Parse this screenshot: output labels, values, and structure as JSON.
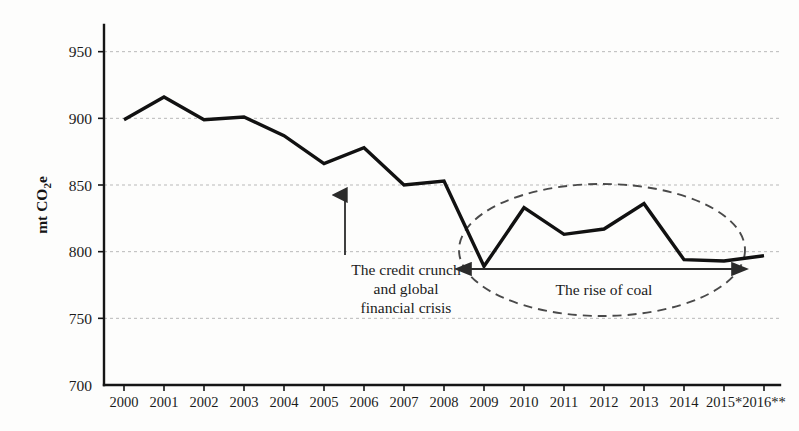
{
  "chart_data": {
    "type": "line",
    "title": "",
    "xlabel": "",
    "ylabel": "mt CO₂e",
    "ylim": [
      700,
      970
    ],
    "xlim_categories_count": 17,
    "grid": true,
    "legend": "none",
    "categories": [
      "2000",
      "2001",
      "2002",
      "2003",
      "2004",
      "2005",
      "2006",
      "2007",
      "2008",
      "2009",
      "2010",
      "2011",
      "2012",
      "2013",
      "2014",
      "2015*",
      "2016**"
    ],
    "values": [
      899,
      916,
      899,
      901,
      887,
      866,
      878,
      850,
      853,
      789,
      833,
      813,
      817,
      836,
      794,
      793,
      797
    ],
    "series": [
      {
        "name": "UK greenhouse gas emissions",
        "values": [
          899,
          916,
          899,
          901,
          887,
          866,
          878,
          850,
          853,
          789,
          833,
          813,
          817,
          836,
          794,
          793,
          797
        ]
      }
    ],
    "ytick_labels": [
      "700",
      "750",
      "800",
      "850",
      "900",
      "950"
    ],
    "ytick_values": [
      700,
      750,
      800,
      850,
      900,
      950
    ],
    "xtick_labels": [
      "2000",
      "2001",
      "2002",
      "2003",
      "2004",
      "2005",
      "2006",
      "2007",
      "2008",
      "2009",
      "2010",
      "2011",
      "2012",
      "2013",
      "2014",
      "2015*",
      "2016**"
    ],
    "annotations": [
      {
        "id": "credit-crunch",
        "lines": [
          "The credit crunch",
          "and global",
          "financial crisis"
        ],
        "text": "The credit crunch and global financial crisis",
        "marker": "up-arrow",
        "points_to_category": "2008"
      },
      {
        "id": "rise-of-coal",
        "lines": [
          "The rise of coal"
        ],
        "text": "The rise of coal",
        "marker": "double-headed-arrow",
        "enclosure": "dashed-ellipse",
        "span_categories": [
          "2009",
          "2016**"
        ]
      }
    ],
    "colors": {
      "series_line": "#111111",
      "grid": "#b9b9b9",
      "axis": "#151515",
      "annotation": "#2b2b2b",
      "ellipse": "#4a4a4a",
      "background": "#fdfdfc"
    }
  },
  "axis": {
    "y_title": "mt CO₂e",
    "y_title_main": "mt CO",
    "y_title_sub": "2",
    "y_title_tail": "e"
  },
  "annotations": {
    "credit_crunch_line1": "The credit crunch",
    "credit_crunch_line2": "and global",
    "credit_crunch_line3": "financial crisis",
    "rise_of_coal": "The rise of coal"
  }
}
